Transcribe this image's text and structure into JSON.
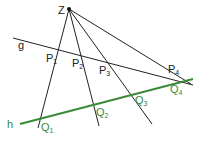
{
  "colors": {
    "black": "#222222",
    "green": "#3a8a3a"
  },
  "center": {
    "label": "Z",
    "x": 69,
    "y": 9
  },
  "line_g": {
    "label": "g",
    "x1": 13,
    "y1": 38,
    "x2": 193,
    "y2": 85
  },
  "line_h": {
    "label": "h",
    "x1": 20,
    "y1": 124,
    "x2": 193,
    "y2": 79
  },
  "rays": [
    {
      "x2": 38,
      "y2": 128
    },
    {
      "x2": 99,
      "y2": 126
    },
    {
      "x2": 152,
      "y2": 124
    },
    {
      "x2": 191,
      "y2": 84
    }
  ],
  "points_g": [
    {
      "label": "P",
      "sub": "1",
      "x": 58,
      "y": 50
    },
    {
      "label": "P",
      "sub": "2",
      "x": 79,
      "y": 55
    },
    {
      "label": "P",
      "sub": "3",
      "x": 106,
      "y": 62
    },
    {
      "label": "P",
      "sub": "4",
      "x": 176,
      "y": 78
    }
  ],
  "points_h": [
    {
      "label": "Q",
      "sub": "1",
      "x": 40,
      "y": 118
    },
    {
      "label": "Q",
      "sub": "2",
      "x": 94,
      "y": 104
    },
    {
      "label": "Q",
      "sub": "3",
      "x": 131,
      "y": 94
    },
    {
      "label": "Q",
      "sub": "4",
      "x": 178,
      "y": 83
    }
  ],
  "labels": {
    "Z": "Z",
    "g": "g",
    "h": "h",
    "P1": "P",
    "P1s": "1",
    "P2": "P",
    "P2s": "2",
    "P3": "P",
    "P3s": "3",
    "P4": "P",
    "P4s": "4",
    "Q1": "Q",
    "Q1s": "1",
    "Q2": "Q",
    "Q2s": "2",
    "Q3": "Q",
    "Q3s": "3",
    "Q4": "Q",
    "Q4s": "4"
  }
}
